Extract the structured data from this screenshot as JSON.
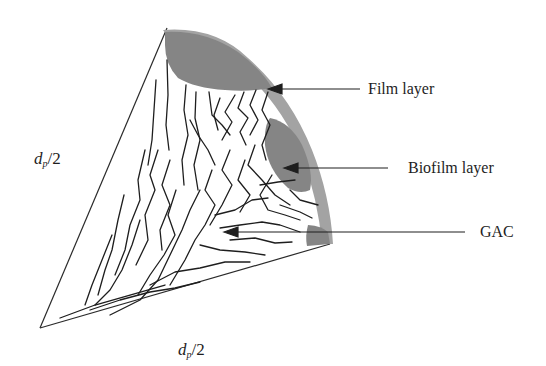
{
  "diagram": {
    "labels": {
      "film_layer": "Film layer",
      "biofilm_layer": "Biofilm layer",
      "gac": "GAC",
      "radius_left": {
        "var": "d",
        "sub": "p",
        "rest": "/2"
      },
      "radius_bottom": {
        "var": "d",
        "sub": "p",
        "rest": "/2"
      }
    },
    "colors": {
      "background": "#ffffff",
      "film_layer": "#9a9a9a",
      "biofilm_layer": "#808080",
      "lines": "#1e1e1e"
    }
  }
}
